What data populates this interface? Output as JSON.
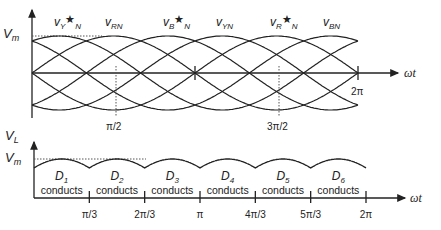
{
  "top_plot": {
    "y_axis_label": "V",
    "y_axis_label_sub": "m",
    "x_axis_label": "ωt",
    "vm_label": "V",
    "vm_label_sub": "m",
    "wave_labels": [
      {
        "main": "v",
        "sub": "Y",
        "star": "★",
        "tail": "N"
      },
      {
        "main": "v",
        "sub": "RN",
        "star": "",
        "tail": ""
      },
      {
        "main": "v",
        "sub": "B",
        "star": "★",
        "tail": "N"
      },
      {
        "main": "v",
        "sub": "YN",
        "star": "",
        "tail": ""
      },
      {
        "main": "v",
        "sub": "R",
        "star": "★",
        "tail": "N"
      },
      {
        "main": "v",
        "sub": "BN",
        "star": "",
        "tail": ""
      }
    ],
    "markers": [
      "π/2",
      "3π/2",
      "2π"
    ]
  },
  "bottom_plot": {
    "y_axis_label": "V",
    "y_axis_label_sub": "L",
    "vm_label": "V",
    "vm_label_sub": "m",
    "x_axis_label": "ωt",
    "segments": [
      {
        "diode": "D",
        "sub": "1",
        "text": "conducts"
      },
      {
        "diode": "D",
        "sub": "2",
        "text": "conducts"
      },
      {
        "diode": "D",
        "sub": "3",
        "text": "conducts"
      },
      {
        "diode": "D",
        "sub": "4",
        "text": "conducts"
      },
      {
        "diode": "D",
        "sub": "5",
        "text": "conducts"
      },
      {
        "diode": "D",
        "sub": "6",
        "text": "conducts"
      }
    ],
    "ticks": [
      "π/3",
      "2π/3",
      "π",
      "4π/3",
      "5π/3",
      "2π"
    ]
  },
  "colors": {
    "line": "#222222",
    "dotted": "#555555",
    "background": "#ffffff"
  }
}
